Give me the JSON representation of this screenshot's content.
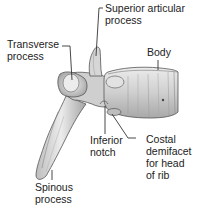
{
  "diagram": {
    "labels": {
      "transverse_process": [
        "Transverse",
        "process"
      ],
      "superior_articular_process": [
        "Superior articular",
        "process"
      ],
      "body": [
        "Body"
      ],
      "inferior_notch": [
        "Inferior",
        "notch"
      ],
      "costal_demifacet": [
        "Costal",
        "demifacet",
        "for head",
        "of rib"
      ],
      "spinous_process": [
        "Spinous",
        "process"
      ]
    },
    "colors": {
      "bone_fill": "#d9d9d9",
      "bone_shade": "#9a9a9a",
      "bone_outline": "#555555",
      "leader_line": "#333333",
      "text": "#222222",
      "background": "#ffffff"
    }
  }
}
